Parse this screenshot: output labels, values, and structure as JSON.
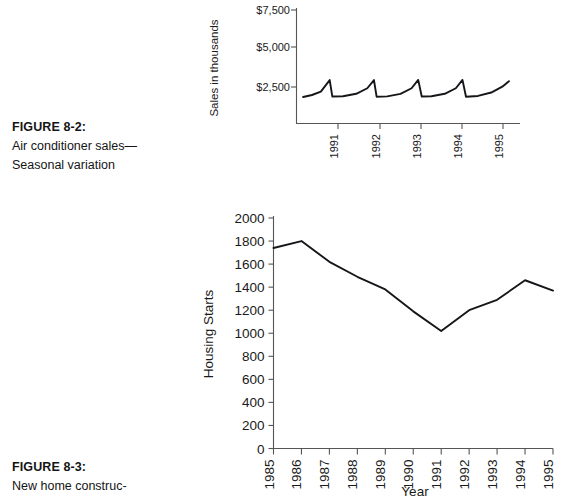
{
  "page": {
    "background": "#ffffff",
    "line_color": "#16161a",
    "axis_color": "#555555",
    "text_color": "#1a1a1a"
  },
  "figures": [
    {
      "id": "8-2",
      "caption_title": "FIGURE 8-2:",
      "caption_lines": [
        "Air conditioner sales—",
        "Seasonal variation"
      ]
    },
    {
      "id": "8-3",
      "caption_title": "FIGURE 8-3:",
      "caption_lines": [
        "New home construc-"
      ]
    }
  ],
  "chart_data": [
    {
      "id": "air-conditioner-sales",
      "type": "line",
      "title": "",
      "xlabel": "",
      "ylabel": "Sales in thousands",
      "ylim": [
        0,
        7500
      ],
      "yticks": [
        2500,
        5000,
        7500
      ],
      "ytick_labels": [
        "$2,500",
        "$5,000",
        "$7,500"
      ],
      "grid": false,
      "legend": null,
      "xtick_labels": [
        "1991",
        "1992",
        "1993",
        "1994",
        "1995"
      ],
      "xtick_rotation": -90,
      "note": "Sawtooth seasonal pattern: gradual rise to a summer peak just before each year tick, then a sharp drop to the off-season trough.",
      "x": [
        1990.4,
        1990.6,
        1990.8,
        1991.0,
        1991.06,
        1991.3,
        1991.6,
        1991.85,
        1992.0,
        1992.06,
        1992.3,
        1992.6,
        1992.85,
        1993.0,
        1993.08,
        1993.3,
        1993.6,
        1993.85,
        1994.0,
        1994.08,
        1994.35,
        1994.65,
        1994.9,
        1995.05
      ],
      "values": [
        1850,
        1980,
        2200,
        2950,
        1880,
        1900,
        2060,
        2420,
        2950,
        1870,
        1890,
        2050,
        2420,
        2960,
        1880,
        1900,
        2060,
        2420,
        2960,
        1870,
        1920,
        2140,
        2520,
        2880
      ]
    },
    {
      "id": "new-home-construction-housing-starts",
      "type": "line",
      "title": "",
      "xlabel": "Year",
      "ylabel": "Housing Starts",
      "ylim": [
        0,
        2000
      ],
      "yticks": [
        0,
        200,
        400,
        600,
        800,
        1000,
        1200,
        1400,
        1600,
        1800,
        2000
      ],
      "ytick_labels": [
        "0",
        "200",
        "400",
        "600",
        "800",
        "1000",
        "1200",
        "1400",
        "1600",
        "1800",
        "2000"
      ],
      "grid": false,
      "legend": null,
      "xtick_rotation": -90,
      "categories": [
        "1985",
        "1986",
        "1987",
        "1988",
        "1989",
        "1990",
        "1991",
        "1992",
        "1993",
        "1994",
        "1995"
      ],
      "values": [
        1740,
        1800,
        1620,
        1490,
        1380,
        1190,
        1020,
        1200,
        1290,
        1460,
        1370
      ]
    }
  ]
}
